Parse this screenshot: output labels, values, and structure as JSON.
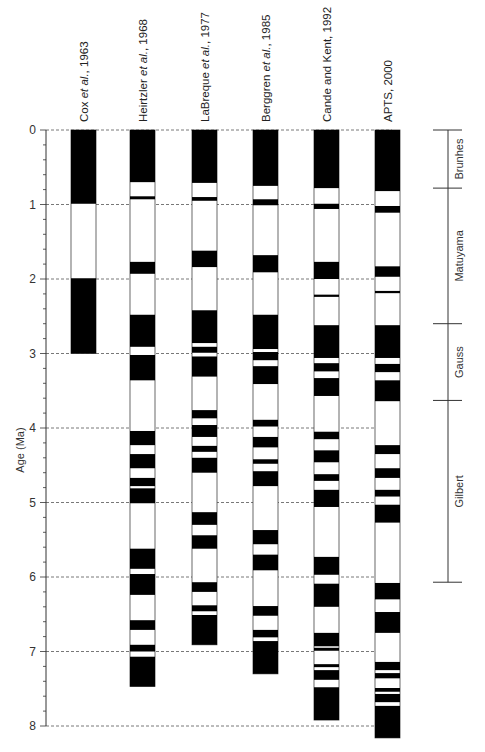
{
  "chart_data": {
    "type": "bar",
    "subtype": "magnetic-polarity-timescale-columns",
    "title": "",
    "ylabel": "Age (Ma)",
    "xlabel": "",
    "ylim": [
      0,
      8
    ],
    "y_ticks": [
      0,
      1,
      2,
      3,
      4,
      5,
      6,
      7,
      8
    ],
    "y_minor_tick_step": 0.2,
    "grid": "dashed horizontal lines at each integer Ma",
    "legend": "black = normal polarity, white = reversed polarity",
    "columns": [
      {
        "name": "Cox et al., 1963",
        "label_main": "Cox ",
        "label_italic": "et al.",
        "label_tail": ", 1963",
        "end": 3.0,
        "normal": [
          [
            0,
            0.99
          ],
          [
            1.99,
            3.0
          ]
        ]
      },
      {
        "name": "Heirtzler et al., 1968",
        "label_main": "Heirtzler ",
        "label_italic": "et al.",
        "label_tail": ", 1968",
        "end": 7.47,
        "normal": [
          [
            0,
            0.7
          ],
          [
            0.89,
            0.93
          ],
          [
            1.77,
            1.93
          ],
          [
            2.48,
            2.91
          ],
          [
            3.02,
            3.36
          ],
          [
            4.04,
            4.23
          ],
          [
            4.35,
            4.54
          ],
          [
            4.67,
            4.78
          ],
          [
            4.81,
            5.01
          ],
          [
            5.62,
            5.89
          ],
          [
            5.96,
            6.24
          ],
          [
            6.58,
            6.71
          ],
          [
            6.91,
            7.0
          ],
          [
            7.07,
            7.47
          ]
        ]
      },
      {
        "name": "LaBreque et al., 1977",
        "label_main": "LaBreque ",
        "label_italic": "et al.",
        "label_tail": ", 1977",
        "end": 6.91,
        "normal": [
          [
            0,
            0.71
          ],
          [
            0.9,
            0.95
          ],
          [
            1.62,
            1.84
          ],
          [
            2.42,
            2.86
          ],
          [
            2.91,
            2.99
          ],
          [
            3.04,
            3.31
          ],
          [
            3.76,
            3.87
          ],
          [
            3.96,
            4.12
          ],
          [
            4.24,
            4.32
          ],
          [
            4.4,
            4.6
          ],
          [
            5.13,
            5.3
          ],
          [
            5.44,
            5.62
          ],
          [
            6.07,
            6.2
          ],
          [
            6.38,
            6.46
          ],
          [
            6.51,
            6.91
          ]
        ]
      },
      {
        "name": "Berggren et al., 1985",
        "label_main": "Berggren ",
        "label_italic": "et al.",
        "label_tail": ", 1985",
        "end": 7.3,
        "normal": [
          [
            0,
            0.75
          ],
          [
            0.93,
            1.01
          ],
          [
            1.68,
            1.91
          ],
          [
            2.48,
            2.94
          ],
          [
            2.98,
            3.09
          ],
          [
            3.17,
            3.41
          ],
          [
            3.89,
            3.98
          ],
          [
            4.12,
            4.26
          ],
          [
            4.42,
            4.48
          ],
          [
            4.58,
            4.78
          ],
          [
            5.37,
            5.56
          ],
          [
            5.7,
            5.91
          ],
          [
            6.39,
            6.52
          ],
          [
            6.71,
            6.81
          ],
          [
            6.86,
            7.3
          ]
        ]
      },
      {
        "name": "Cande and Kent, 1992",
        "label_main": "Cande and Kent, 1992",
        "label_italic": "",
        "label_tail": "",
        "end": 7.92,
        "normal": [
          [
            0,
            0.78
          ],
          [
            0.99,
            1.06
          ],
          [
            1.77,
            2.0
          ],
          [
            2.21,
            2.24
          ],
          [
            2.62,
            3.06
          ],
          [
            3.13,
            3.24
          ],
          [
            3.33,
            3.57
          ],
          [
            4.05,
            4.15
          ],
          [
            4.3,
            4.46
          ],
          [
            4.62,
            4.71
          ],
          [
            4.83,
            5.06
          ],
          [
            5.73,
            5.97
          ],
          [
            6.09,
            6.4
          ],
          [
            6.75,
            6.93
          ],
          [
            6.95,
            6.99
          ],
          [
            7.17,
            7.21
          ],
          [
            7.25,
            7.38
          ],
          [
            7.48,
            7.92
          ]
        ]
      },
      {
        "name": "APTS, 2000",
        "label_main": "APTS, 2000",
        "label_italic": "",
        "label_tail": "",
        "end": 8.16,
        "normal": [
          [
            0,
            0.82
          ],
          [
            1.02,
            1.11
          ],
          [
            1.83,
            1.97
          ],
          [
            2.16,
            2.19
          ],
          [
            2.62,
            3.06
          ],
          [
            3.14,
            3.25
          ],
          [
            3.36,
            3.64
          ],
          [
            4.23,
            4.35
          ],
          [
            4.54,
            4.67
          ],
          [
            4.83,
            4.92
          ],
          [
            5.03,
            5.27
          ],
          [
            6.08,
            6.3
          ],
          [
            6.47,
            6.75
          ],
          [
            7.14,
            7.25
          ],
          [
            7.29,
            7.36
          ],
          [
            7.49,
            7.54
          ],
          [
            7.57,
            7.68
          ],
          [
            7.73,
            8.16
          ]
        ]
      }
    ],
    "chrons": [
      {
        "name": "Brunhes",
        "start": 0,
        "end": 0.78
      },
      {
        "name": "Matuyama",
        "start": 0.78,
        "end": 2.6
      },
      {
        "name": "Gauss",
        "start": 2.6,
        "end": 3.63
      },
      {
        "name": "Gilbert",
        "start": 3.63,
        "end": 6.07
      }
    ]
  }
}
